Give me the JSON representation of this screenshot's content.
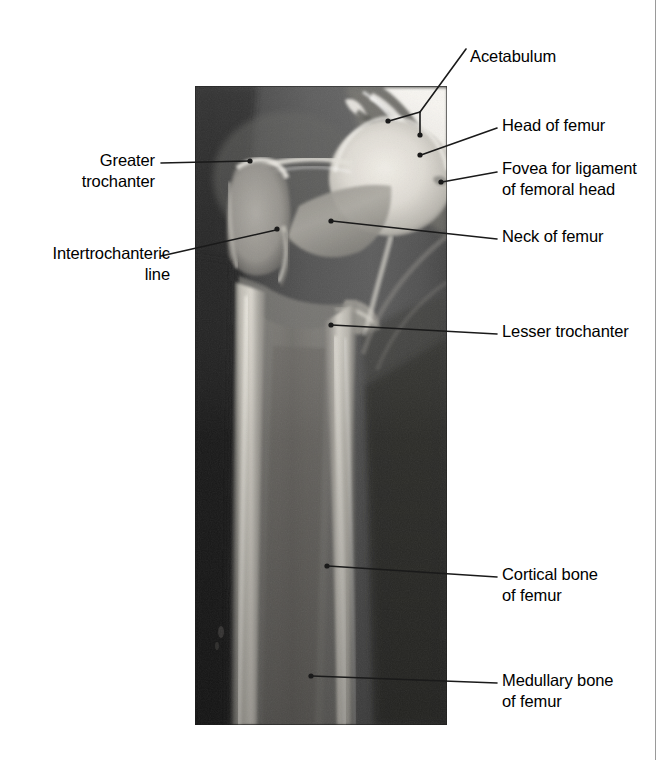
{
  "figure": {
    "modality": "X-ray",
    "view": "anteroposterior hip and proximal femur",
    "background_color": "#ffffff",
    "text_color": "#000000",
    "leader_color": "#1a1a1a",
    "page_rule_color": "#9a9a9a"
  },
  "labels": {
    "acetabulum": "Acetabulum",
    "head_of_femur": "Head of femur",
    "fovea": "Fovea for ligament\nof femoral head",
    "neck_of_femur": "Neck of femur",
    "lesser_trochanter": "Lesser trochanter",
    "cortical_bone": "Cortical bone\nof femur",
    "medullary_bone": "Medullary bone\nof femur",
    "greater_trochanter": "Greater\ntrochanter",
    "intertrochanteric_line": "Intertrochanteric\nline"
  },
  "annotations": [
    {
      "id": "acetabulum",
      "label": "Acetabulum",
      "side": "right",
      "style": "branched",
      "text_anchor": [
        470,
        60
      ],
      "elbow": [
        420,
        112
      ],
      "stem_start": [
        466,
        49
      ],
      "points": [
        [
          387,
          122
        ],
        [
          420,
          135
        ]
      ]
    },
    {
      "id": "head-of-femur",
      "label": "Head of femur",
      "side": "right",
      "style": "simple",
      "text_anchor": [
        502,
        128
      ],
      "line_start": [
        497,
        128
      ],
      "point": [
        420,
        155
      ]
    },
    {
      "id": "fovea",
      "label": "Fovea for ligament of femoral head",
      "side": "right",
      "style": "simple",
      "text_anchor": [
        502,
        172
      ],
      "line_start": [
        497,
        172
      ],
      "point": [
        441,
        182
      ]
    },
    {
      "id": "neck-of-femur",
      "label": "Neck of femur",
      "side": "right",
      "style": "simple",
      "text_anchor": [
        502,
        239
      ],
      "line_start": [
        497,
        239
      ],
      "point": [
        331,
        221
      ]
    },
    {
      "id": "lesser-trochanter",
      "label": "Lesser trochanter",
      "side": "right",
      "style": "simple",
      "text_anchor": [
        502,
        334
      ],
      "line_start": [
        497,
        334
      ],
      "point": [
        331,
        325
      ]
    },
    {
      "id": "cortical-bone",
      "label": "Cortical bone of femur",
      "side": "right",
      "style": "simple",
      "text_anchor": [
        502,
        577
      ],
      "line_start": [
        497,
        577
      ],
      "point": [
        327,
        566
      ]
    },
    {
      "id": "medullary-bone",
      "label": "Medullary bone of femur",
      "side": "right",
      "style": "simple",
      "text_anchor": [
        502,
        683
      ],
      "line_start": [
        497,
        683
      ],
      "point": [
        311,
        676
      ]
    },
    {
      "id": "greater-trochanter",
      "label": "Greater trochanter",
      "side": "left",
      "style": "simple",
      "text_anchor": [
        155,
        163
      ],
      "line_start": [
        161,
        163
      ],
      "point": [
        250,
        161
      ]
    },
    {
      "id": "intertrochanteric-line",
      "label": "Intertrochanteric line",
      "side": "left",
      "style": "simple",
      "text_anchor": [
        155,
        256
      ],
      "line_start": [
        161,
        256
      ],
      "point": [
        277,
        229
      ]
    }
  ],
  "xray": {
    "bounds": {
      "x": 195,
      "y": 86,
      "width": 252,
      "height": 639
    },
    "tones": {
      "soft_tissue_dark": "#2b2b2b",
      "soft_tissue_mid": "#555555",
      "muscle_shadow": "#6a6a6a",
      "trabecular_bone": "#9a9a9a",
      "cortical_bone_bright": "#d8d6cf",
      "femoral_head_bright": "#e6e3dc",
      "acetabulum_highlight": "#f2f0ea",
      "medullary_canal": "#7e7c78"
    },
    "regions": [
      "pelvis / acetabulum (top right, bright)",
      "femoral head (bright rounded mass)",
      "fovea for ligament of femoral head (notch on head)",
      "neck of femur (diagonal band)",
      "greater trochanter (left prominence)",
      "intertrochanteric line (ridge below greater trochanter)",
      "lesser trochanter (medial prominence)",
      "femoral shaft with bright cortical walls",
      "medullary canal (darker centre of shaft)",
      "surrounding soft tissue (dark left and right margins)"
    ]
  }
}
